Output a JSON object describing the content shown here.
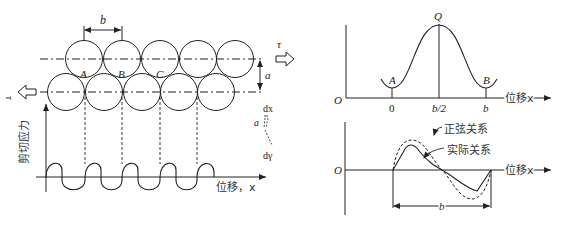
{
  "left_figure": {
    "lattice": {
      "spacing_label": "b",
      "layer_gap_label": "a",
      "sites": [
        "A",
        "B",
        "C"
      ]
    },
    "shear": {
      "tau_top": "τ",
      "tau_bottom": "τ"
    },
    "strain_inset": {
      "dx_label": "dx",
      "a_label": "a",
      "dgamma_label": "dγ"
    },
    "plot": {
      "ylabel": "剪切应力",
      "xlabel": "位移，x"
    }
  },
  "right_top": {
    "origin_label": "O",
    "peak_label": "Q",
    "min_left_label": "A",
    "min_right_label": "B",
    "xtick_0": "0",
    "xtick_mid": "b/2",
    "xtick_end": "b",
    "xlabel": "位移x"
  },
  "right_bottom": {
    "origin_label": "O",
    "legend_sine": "正弦关系",
    "legend_actual": "实际关系",
    "xlabel": "位移x",
    "period_label": "b"
  },
  "colors": {
    "line": "#222222",
    "background": "#ffffff"
  }
}
